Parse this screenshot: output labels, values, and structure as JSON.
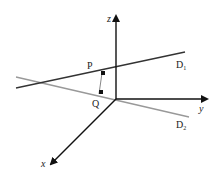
{
  "diagram": {
    "title": "",
    "axes": {
      "x": {
        "label": "x"
      },
      "y": {
        "label": "y"
      },
      "z": {
        "label": "z"
      }
    },
    "lines": [
      {
        "name": "D1",
        "label_main": "D",
        "label_sub": "1",
        "color": "#333333"
      },
      {
        "name": "D2",
        "label_main": "D",
        "label_sub": "2",
        "color": "#999999"
      }
    ],
    "points": [
      {
        "name": "P",
        "label": "P"
      },
      {
        "name": "Q",
        "label": "Q"
      }
    ],
    "segment": {
      "from": "P",
      "to": "Q",
      "color": "#888888",
      "note": "common perpendicular"
    },
    "colors": {
      "axis": "#111111",
      "D1": "#333333",
      "D2": "#999999",
      "marker": "#111111"
    }
  }
}
